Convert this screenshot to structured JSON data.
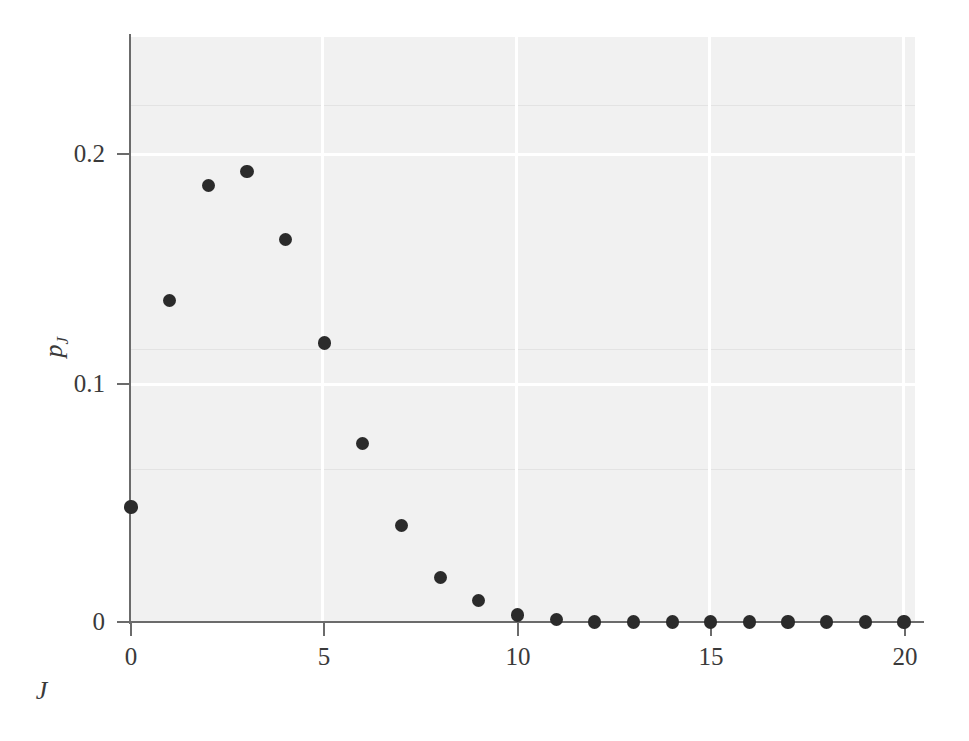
{
  "chart_data": {
    "type": "scatter",
    "title": "",
    "xlabel": "J",
    "ylabel": "p_J",
    "ylabel_base": "p",
    "ylabel_sub": "J",
    "x": [
      0,
      1,
      2,
      3,
      4,
      5,
      6,
      7,
      8,
      9,
      10,
      11,
      12,
      13,
      14,
      15,
      16,
      17,
      18,
      19,
      20
    ],
    "values": [
      0.049,
      0.137,
      0.186,
      0.192,
      0.163,
      0.119,
      0.076,
      0.041,
      0.019,
      0.009,
      0.003,
      0.001,
      0.0,
      0.0,
      0.0,
      0.0,
      0.0,
      0.0,
      0.0,
      0.0,
      0.0
    ],
    "series": [
      {
        "name": "p_J",
        "values": [
          0.049,
          0.137,
          0.186,
          0.192,
          0.163,
          0.119,
          0.076,
          0.041,
          0.019,
          0.009,
          0.003,
          0.001,
          0.0,
          0.0,
          0.0,
          0.0,
          0.0,
          0.0,
          0.0,
          0.0,
          0.0
        ]
      }
    ],
    "xlim": [
      -0.35,
      20.3
    ],
    "ylim": [
      0,
      0.2455
    ],
    "xticks": [
      0,
      5,
      10,
      15,
      20
    ],
    "xticklabels": [
      "0",
      "5",
      "10",
      "15",
      "20"
    ],
    "yticks": [
      0,
      0.1,
      0.2
    ],
    "yticklabels": [
      "0",
      "0.1",
      "0.2"
    ],
    "grid": true,
    "gridlines_x": [
      5,
      10,
      15,
      20
    ],
    "gridlines_y": [
      0.1,
      0.2
    ],
    "legend": null,
    "marker": "filled-circle",
    "marker_color": "#2b2b2b",
    "panel_color": "#f1f1f1",
    "grid_color": "#ffffff",
    "axis_color": "#6b6b6b"
  },
  "axes": {
    "y_tick_labels": [
      {
        "text": "0.2",
        "value": 0.2
      },
      {
        "text": "0.1",
        "value": 0.1
      },
      {
        "text": "0",
        "value": 0.0
      }
    ],
    "x_tick_labels": [
      {
        "text": "0",
        "value": 0
      },
      {
        "text": "5",
        "value": 5
      },
      {
        "text": "10",
        "value": 10
      },
      {
        "text": "15",
        "value": 15
      },
      {
        "text": "20",
        "value": 20
      }
    ]
  }
}
